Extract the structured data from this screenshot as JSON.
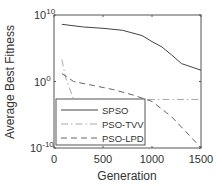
{
  "chart_data": {
    "type": "line",
    "title": "",
    "xlabel": "Generation",
    "ylabel": "Average Best Fitness",
    "xlim": [
      0,
      1500
    ],
    "ylim_log10": [
      -10,
      10
    ],
    "yscale": "log",
    "xticks": [
      "0",
      "500",
      "1000",
      "1500"
    ],
    "yticks": [
      {
        "base": "10",
        "exp": "10"
      },
      {
        "base": "10",
        "exp": "0"
      },
      {
        "base": "10",
        "exp": "-10"
      }
    ],
    "grid": false,
    "legend_position": "lower left",
    "series": [
      {
        "name": "SPSO",
        "style": "solid",
        "x": [
          80,
          300,
          500,
          700,
          900,
          1000,
          1100,
          1200,
          1300,
          1500
        ],
        "log10_y": [
          8.6,
          8.2,
          8.0,
          7.7,
          6.9,
          6.0,
          5.2,
          4.0,
          2.7,
          1.7
        ]
      },
      {
        "name": "PSO-TVV",
        "style": "dashdot",
        "x": [
          80,
          120,
          200,
          300,
          500,
          1000,
          1500
        ],
        "log10_y": [
          3.3,
          0.5,
          -2.7,
          -2.7,
          -2.7,
          -2.7,
          -2.7
        ]
      },
      {
        "name": "PSO-LPD",
        "style": "dashed",
        "x": [
          80,
          200,
          400,
          600,
          800,
          1000,
          1200,
          1400,
          1500
        ],
        "log10_y": [
          1.2,
          0.0,
          -0.6,
          -1.2,
          -2.0,
          -3.0,
          -5.3,
          -8.4,
          -10.0
        ]
      }
    ]
  }
}
